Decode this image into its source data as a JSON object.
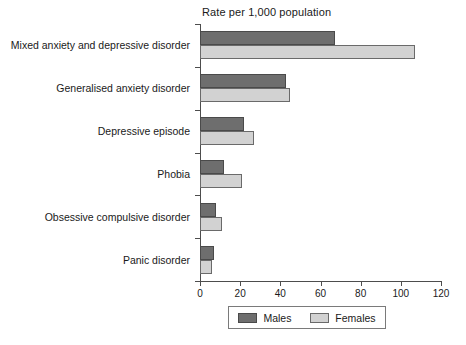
{
  "chart_data": {
    "type": "bar",
    "orientation": "horizontal",
    "title": "Rate per 1,000 population",
    "xlabel": "",
    "ylabel": "",
    "xlim": [
      0,
      120
    ],
    "xticks": [
      0,
      20,
      40,
      60,
      80,
      100,
      120
    ],
    "grid": false,
    "legend_position": "bottom",
    "categories": [
      "Mixed anxiety and depressive disorder",
      "Generalised anxiety disorder",
      "Depressive episode",
      "Phobia",
      "Obsessive compulsive disorder",
      "Panic disorder"
    ],
    "series": [
      {
        "name": "Males",
        "color": "#6e6e6e",
        "values": [
          67,
          43,
          22,
          12,
          8,
          7
        ]
      },
      {
        "name": "Females",
        "color": "#d2d2d2",
        "values": [
          107,
          45,
          27,
          21,
          11,
          6
        ]
      }
    ]
  },
  "legend": {
    "entries": [
      {
        "label": "Males"
      },
      {
        "label": "Females"
      }
    ]
  }
}
